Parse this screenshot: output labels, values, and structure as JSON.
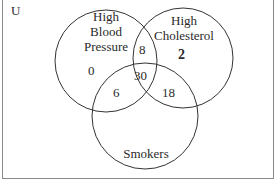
{
  "diagram": {
    "universe_label": "U",
    "sets": [
      {
        "name": "High Blood Pressure",
        "lines": [
          "High",
          "Blood",
          "Pressure"
        ]
      },
      {
        "name": "High Cholesterol",
        "lines": [
          "High",
          "Cholesterol"
        ]
      },
      {
        "name": "Smokers",
        "lines": [
          "Smokers"
        ]
      }
    ],
    "regions": {
      "bp_only": "0",
      "chol_only": "2",
      "bp_chol_only": "8",
      "bp_smokers_only": "6",
      "chol_smokers_only": "18",
      "all_three": "30"
    },
    "colors": {
      "stroke": "#333333",
      "border": "#8a8a8a",
      "text": "#2a2a2a"
    }
  }
}
